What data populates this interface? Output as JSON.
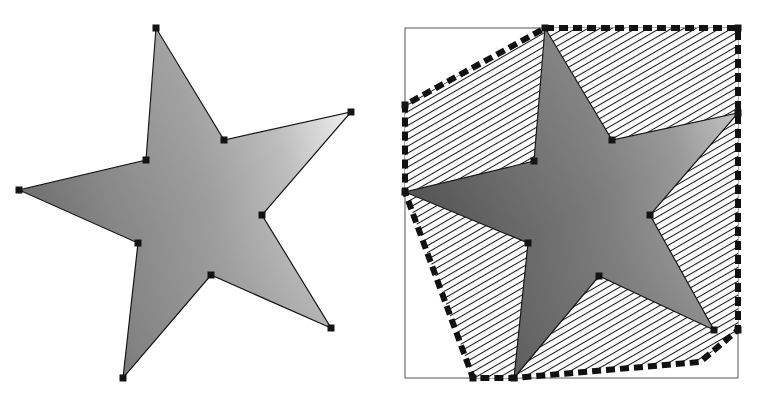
{
  "figure": {
    "background_color": "#ffffff",
    "width": 761,
    "height": 399,
    "panel_count": 2,
    "panels": [
      {
        "name": "star-polygon-panel",
        "caption": "",
        "description": "Gradient shaded five-pointed star polygon with square vertex markers"
      },
      {
        "name": "convex-hull-panel",
        "caption": "",
        "description": "Same star polygon overlaid with its convex hull drawn as a thick dashed outline, hatched interior and a thin axis-aligned bounding box"
      }
    ]
  },
  "colors": {
    "outline": "#141414",
    "vertex_marker": "#141414",
    "hull_stroke": "#111111",
    "hatch_stroke": "#1a1a1a",
    "bbox_stroke": "#555555",
    "star_fill_dark": "#6e6e6e",
    "star_fill_mid": "#9a9a9a",
    "star_fill_light": "#d8d8d8",
    "hull_fill": "#ffffff",
    "background": "#ffffff"
  },
  "style": {
    "hull_dash_pattern": "9 5",
    "hull_stroke_width": 6,
    "star_outline_width": 1.2,
    "bbox_stroke_width": 1,
    "vertex_marker_size": 7,
    "hatch_angle_degrees": 60,
    "hatch_spacing": 5
  },
  "shapes": {
    "star_left": {
      "name": "star-polygon",
      "vertex_count": 10,
      "points": [
        [
          156,
          28
        ],
        [
          224,
          140
        ],
        [
          351,
          112
        ],
        [
          262,
          215
        ],
        [
          331,
          328
        ],
        [
          211,
          275
        ],
        [
          123,
          378
        ],
        [
          138,
          243
        ],
        [
          19,
          190
        ],
        [
          146,
          160
        ]
      ],
      "marker_points": [
        [
          156,
          28
        ],
        [
          224,
          140
        ],
        [
          351,
          112
        ],
        [
          262,
          215
        ],
        [
          331,
          328
        ],
        [
          211,
          275
        ],
        [
          123,
          378
        ],
        [
          138,
          243
        ],
        [
          19,
          190
        ],
        [
          146,
          160
        ]
      ]
    },
    "star_right": {
      "name": "star-polygon",
      "vertex_count": 10,
      "points": [
        [
          545,
          28
        ],
        [
          612,
          140
        ],
        [
          738,
          113
        ],
        [
          650,
          215
        ],
        [
          714,
          330
        ],
        [
          599,
          276
        ],
        [
          514,
          378
        ],
        [
          528,
          243
        ],
        [
          405,
          192
        ],
        [
          534,
          161
        ]
      ],
      "marker_points": [
        [
          612,
          140
        ],
        [
          650,
          215
        ],
        [
          599,
          276
        ],
        [
          528,
          243
        ],
        [
          534,
          161
        ]
      ]
    },
    "convex_hull": {
      "name": "convex-hull-polygon",
      "vertex_count": 6,
      "points": [
        [
          545,
          28
        ],
        [
          738,
          28
        ],
        [
          738,
          113
        ],
        [
          738,
          330
        ],
        [
          700,
          362
        ],
        [
          514,
          378
        ],
        [
          473,
          378
        ],
        [
          405,
          192
        ],
        [
          405,
          105
        ]
      ],
      "marker_points": [
        [
          545,
          28
        ],
        [
          738,
          28
        ],
        [
          738,
          113
        ],
        [
          738,
          330
        ],
        [
          714,
          330
        ],
        [
          514,
          378
        ],
        [
          473,
          378
        ],
        [
          405,
          192
        ],
        [
          405,
          105
        ]
      ]
    },
    "bounding_box": {
      "name": "bounding-box",
      "x": 405,
      "y": 28,
      "width": 333,
      "height": 350
    }
  }
}
